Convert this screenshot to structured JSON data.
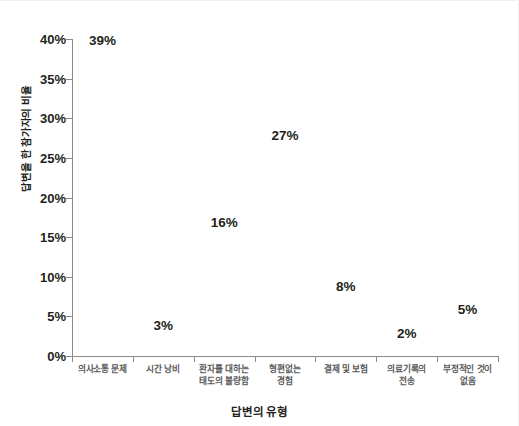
{
  "chart_data": {
    "type": "scatter",
    "title": "",
    "xlabel": "답변의 유형",
    "ylabel": "답변을 한 참가자의 비율",
    "categories": [
      "의사소통 문제",
      "시간 낭비",
      "환자를 대하는\n태도의 불량함",
      "형편없는\n경험",
      "결제 및 보험",
      "의료기록의\n전송",
      "부정적인 것이\n없음"
    ],
    "values": [
      39,
      3,
      16,
      27,
      8,
      2,
      5
    ],
    "value_labels": [
      "39%",
      "3%",
      "16%",
      "27%",
      "8%",
      "2%",
      "5%"
    ],
    "ylim": [
      0,
      40
    ],
    "ytick_values": [
      0,
      5,
      10,
      15,
      20,
      25,
      30,
      35,
      40
    ],
    "ytick_labels": [
      "0%",
      "5%",
      "10%",
      "15%",
      "20%",
      "25%",
      "30%",
      "35%",
      "40%"
    ],
    "grid": false,
    "legend": null,
    "colors": {
      "text": "#231f20",
      "axis": "#8a8a8a",
      "category_text": "#5a5a5a",
      "background": "#ffffff"
    }
  }
}
